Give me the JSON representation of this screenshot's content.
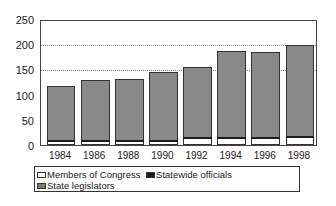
{
  "chart_data": {
    "type": "bar",
    "stacked": true,
    "title": "",
    "xlabel": "",
    "ylabel": "",
    "ylim": [
      0,
      250
    ],
    "yticks": [
      0,
      50,
      100,
      150,
      200,
      250
    ],
    "ytick_labels": [
      "0",
      "50",
      "100",
      "150",
      "200",
      "250"
    ],
    "grid": {
      "horizontal": true,
      "style": "dotted",
      "lines_at": [
        150,
        200
      ]
    },
    "categories": [
      "1984",
      "1986",
      "1988",
      "1990",
      "1992",
      "1994",
      "1996",
      "1998"
    ],
    "series": [
      {
        "name": "Members of Congress",
        "values": [
          6,
          6,
          6,
          6,
          12,
          12,
          12,
          14
        ],
        "color": "#ffffff"
      },
      {
        "name": "Statewide officials",
        "values": [
          3,
          3,
          3,
          3,
          4,
          4,
          4,
          4
        ],
        "color": "#1e1e1e"
      },
      {
        "name": "State legislators",
        "values": [
          108,
          120,
          122,
          136,
          139,
          171,
          169,
          180
        ],
        "color": "#9a9a9a"
      }
    ],
    "totals": [
      117,
      129,
      131,
      145,
      155,
      187,
      185,
      198
    ],
    "legend": {
      "position": "bottom",
      "entries": [
        "Members of Congress",
        "Statewide officials",
        "State legislators"
      ]
    }
  },
  "legend": {
    "congress": "Members of Congress",
    "statewide": "Statewide officials",
    "legis": "State legislators"
  }
}
